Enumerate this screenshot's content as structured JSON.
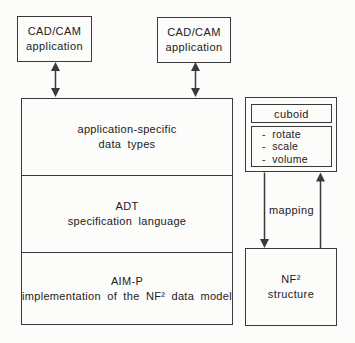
{
  "colors": {
    "line": "#3a3a3a",
    "text": "#222222",
    "background": "#fcfcfa"
  },
  "cad_left": {
    "line1": "CAD/CAM",
    "line2": "application"
  },
  "cad_right": {
    "line1": "CAD/CAM",
    "line2": "application"
  },
  "stack": {
    "layers": [
      {
        "line1": "application-specific",
        "line2": "data types"
      },
      {
        "line1": "ADT",
        "line2": "specification language"
      },
      {
        "line1": "AIM-P",
        "line2": "implementation of the NF² data model"
      }
    ]
  },
  "cuboid": {
    "title": "cuboid",
    "operations": [
      "-  rotate",
      "-  scale",
      "-  volume"
    ]
  },
  "mapping_label": "mapping",
  "nf2": {
    "line1": "NF²",
    "line2": "structure"
  }
}
